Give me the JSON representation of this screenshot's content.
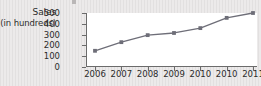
{
  "figure": {
    "background_color": "#eceaea",
    "plot_background_color": "#ffffff",
    "axis_color": "#6b6b6b",
    "series_color": "#6e6e78",
    "axis_title_line1": "Sales",
    "axis_title_line2": "(in hundreds)"
  },
  "chart_data": {
    "type": "line",
    "title": "",
    "xlabel": "",
    "ylabel": "Sales (in hundreds)",
    "categories": [
      "2006",
      "2007",
      "2008",
      "2009",
      "2010",
      "2010",
      "2011"
    ],
    "values": [
      150,
      230,
      295,
      315,
      360,
      455,
      500
    ],
    "ylim": [
      0,
      500
    ],
    "yticks": [
      0,
      100,
      200,
      300,
      400,
      500
    ],
    "ytick_labels": [
      "0",
      "100",
      "200",
      "300",
      "400",
      "500"
    ],
    "xtick_labels": [
      "2006",
      "2007",
      "2008",
      "2009",
      "2010",
      "2010",
      "2011"
    ],
    "grid": false,
    "legend": "none",
    "markers": true,
    "series": [
      {
        "name": "Sales",
        "values": [
          150,
          230,
          295,
          315,
          360,
          455,
          500
        ]
      }
    ]
  }
}
